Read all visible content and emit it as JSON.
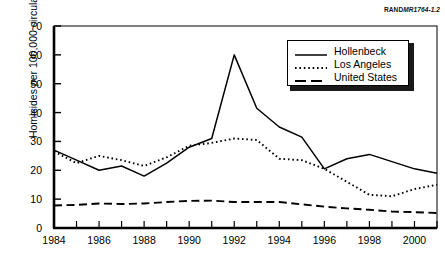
{
  "source_note": {
    "bold_part": "RAND",
    "italic_part": "MR1764-1.2"
  },
  "chart_data": {
    "type": "line",
    "title": "",
    "xlabel": "",
    "ylabel": "Homicides per 100,000 circulation",
    "xlim": [
      1984,
      2001
    ],
    "ylim": [
      0,
      70
    ],
    "yticks": [
      0,
      10,
      20,
      30,
      40,
      50,
      60,
      70
    ],
    "ytick_labels": [
      "0",
      "10",
      "20",
      "30",
      "40",
      "50",
      "60",
      "70"
    ],
    "xticks": [
      1984,
      1985,
      1986,
      1987,
      1988,
      1989,
      1990,
      1991,
      1992,
      1993,
      1994,
      1995,
      1996,
      1997,
      1998,
      1999,
      2000,
      2001
    ],
    "xtick_labels_shown": [
      "1984",
      "1986",
      "1988",
      "1990",
      "1992",
      "1994",
      "1996",
      "1998",
      "2000"
    ],
    "xtick_label_years": [
      1984,
      1986,
      1988,
      1990,
      1992,
      1994,
      1996,
      1998,
      2000
    ],
    "grid": false,
    "legend_position": "upper right",
    "x": [
      1984,
      1985,
      1986,
      1987,
      1988,
      1989,
      1990,
      1991,
      1992,
      1993,
      1994,
      1995,
      1996,
      1997,
      1998,
      1999,
      2000,
      2001
    ],
    "series": [
      {
        "name": "Hollenbeck",
        "style": "solid",
        "color": "#000000",
        "values": [
          27,
          23.5,
          20,
          21.5,
          18,
          22.5,
          28,
          31,
          60,
          41.5,
          35,
          31.5,
          20.5,
          24,
          25.5,
          23,
          20.5,
          19
        ]
      },
      {
        "name": "Los Angeles",
        "style": "dotted",
        "color": "#000000",
        "values": [
          26.5,
          22.5,
          25,
          23.5,
          21.5,
          24.5,
          28.5,
          29.5,
          31,
          30.5,
          24,
          23.5,
          20.5,
          16,
          11.5,
          11,
          13.5,
          15
        ]
      },
      {
        "name": "United States",
        "style": "dashed",
        "color": "#000000",
        "values": [
          7.8,
          8,
          8.5,
          8.3,
          8.5,
          9,
          9.4,
          9.5,
          9,
          9,
          9,
          8.2,
          7.4,
          6.8,
          6.3,
          5.7,
          5.5,
          5.2
        ]
      }
    ]
  }
}
